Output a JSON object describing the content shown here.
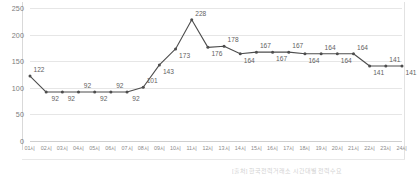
{
  "chart_data": {
    "type": "line",
    "title": "",
    "subtitle": "",
    "xlabel": "",
    "ylabel": "",
    "ylim": [
      0,
      250
    ],
    "yticks": [
      0,
      50,
      100,
      150,
      200,
      250
    ],
    "grid": true,
    "legend": false,
    "legend_position": "none",
    "line_color": "#4d4d4d",
    "marker_color": "#4d4d4d",
    "categories": [
      "01시",
      "02시",
      "03시",
      "04시",
      "05시",
      "06시",
      "07시",
      "08시",
      "09시",
      "10시",
      "11시",
      "12시",
      "13시",
      "14시",
      "15시",
      "16시",
      "17시",
      "18시",
      "19시",
      "20시",
      "21시",
      "22시",
      "23시",
      "24시"
    ],
    "values": [
      122,
      92,
      92,
      92,
      92,
      92,
      92,
      101,
      143,
      173,
      228,
      176,
      178,
      164,
      167,
      167,
      167,
      164,
      164,
      164,
      164,
      141,
      141,
      141
    ],
    "point_labels": [
      {
        "value": "122",
        "position": "above"
      },
      {
        "value": "92",
        "position": "below"
      },
      {
        "value": "92",
        "position": "below"
      },
      {
        "value": "92",
        "position": "above"
      },
      {
        "value": "92",
        "position": "below"
      },
      {
        "value": "92",
        "position": "above"
      },
      {
        "value": "92",
        "position": "below"
      },
      {
        "value": "101",
        "position": "above"
      },
      {
        "value": "143",
        "position": "below"
      },
      {
        "value": "173",
        "position": "below"
      },
      {
        "value": "228",
        "position": "above"
      },
      {
        "value": "176",
        "position": "below"
      },
      {
        "value": "178",
        "position": "above"
      },
      {
        "value": "164",
        "position": "below"
      },
      {
        "value": "167",
        "position": "above"
      },
      {
        "value": "167",
        "position": "below"
      },
      {
        "value": "167",
        "position": "above"
      },
      {
        "value": "164",
        "position": "below"
      },
      {
        "value": "164",
        "position": "above"
      },
      {
        "value": "164",
        "position": "below"
      },
      {
        "value": "164",
        "position": "above"
      },
      {
        "value": "141",
        "position": "below"
      },
      {
        "value": "141",
        "position": "above"
      },
      {
        "value": "141",
        "position": "below"
      }
    ]
  },
  "caption": {
    "text": "[출처] 한국전력거래소 시간대별 전력수요"
  }
}
